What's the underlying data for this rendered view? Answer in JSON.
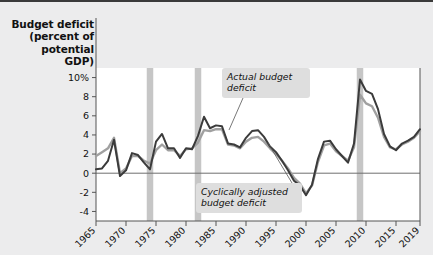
{
  "chart": {
    "type": "line",
    "y_axis_title": "Budget deficit (percent of potential GDP)",
    "y_axis_title_lines": [
      "Budget deficit",
      "(percent of",
      "potential",
      "GDP)"
    ],
    "y_ticks": [
      "10%",
      "8",
      "6",
      "4",
      "2",
      "0",
      "-2",
      "-4"
    ],
    "y_tick_values": [
      10,
      8,
      6,
      4,
      2,
      0,
      -2,
      -4
    ],
    "x_ticks": [
      "1965",
      "1970",
      "1975",
      "1980",
      "1985",
      "1990",
      "1995",
      "2000",
      "2005",
      "2010",
      "2015",
      "2019"
    ],
    "x_tick_values": [
      1965,
      1970,
      1975,
      1980,
      1985,
      1990,
      1995,
      2000,
      2005,
      2010,
      2015,
      2019
    ],
    "annotations": [
      {
        "id": "actual",
        "text": "Actual budget deficit"
      },
      {
        "id": "cyclically-adjusted",
        "text": "Cyclically adjusted budget deficit"
      }
    ],
    "colors": {
      "background": "#ececed",
      "plot_background": "#ffffff",
      "actual_line": "#3b3b3b",
      "cyclical_line": "#a0a0a0",
      "recession_band": "#c6c6c6",
      "zero_line": "#6e6e6e",
      "axis": "#555555",
      "annotation_box": "#dedede"
    },
    "recession_bands": [
      1974,
      1982,
      2009
    ],
    "legend_position": "inline-annotations",
    "grid": false,
    "xlim": [
      1965,
      2019
    ],
    "ylim": [
      -5,
      11
    ]
  },
  "chart_data": {
    "type": "line",
    "title": "",
    "xlabel": "",
    "ylabel": "Budget deficit (percent of potential GDP)",
    "xlim": [
      1965,
      2019
    ],
    "ylim": [
      -5,
      11
    ],
    "grid": false,
    "legend_position": "inline-annotations",
    "x": [
      1965,
      1966,
      1967,
      1968,
      1969,
      1970,
      1971,
      1972,
      1973,
      1974,
      1975,
      1976,
      1977,
      1978,
      1979,
      1980,
      1981,
      1982,
      1983,
      1984,
      1985,
      1986,
      1987,
      1988,
      1989,
      1990,
      1991,
      1992,
      1993,
      1994,
      1995,
      1996,
      1997,
      1998,
      1999,
      2000,
      2001,
      2002,
      2003,
      2004,
      2005,
      2006,
      2007,
      2008,
      2009,
      2010,
      2011,
      2012,
      2013,
      2014,
      2015,
      2016,
      2017,
      2018,
      2019
    ],
    "series": [
      {
        "name": "Actual budget deficit",
        "color": "#3b3b3b",
        "values": [
          0.4,
          0.5,
          1.3,
          3.5,
          -0.3,
          0.3,
          2.1,
          1.9,
          1.1,
          0.4,
          3.3,
          4.1,
          2.6,
          2.6,
          1.6,
          2.6,
          2.5,
          3.9,
          5.9,
          4.7,
          5.0,
          4.9,
          3.1,
          3.0,
          2.7,
          3.7,
          4.4,
          4.5,
          3.8,
          2.8,
          2.2,
          1.3,
          0.3,
          -0.8,
          -1.3,
          -2.3,
          -1.2,
          1.5,
          3.3,
          3.4,
          2.5,
          1.8,
          1.1,
          3.1,
          9.8,
          8.6,
          8.3,
          6.7,
          4.1,
          2.8,
          2.4,
          3.1,
          3.4,
          3.8,
          4.6
        ]
      },
      {
        "name": "Cyclically adjusted budget deficit",
        "color": "#a0a0a0",
        "values": [
          1.8,
          2.2,
          2.6,
          3.7,
          0.0,
          0.5,
          1.8,
          1.8,
          1.3,
          1.0,
          2.4,
          3.0,
          2.4,
          2.4,
          1.8,
          2.5,
          2.6,
          3.2,
          4.5,
          4.4,
          4.6,
          4.6,
          3.0,
          2.9,
          2.6,
          3.3,
          3.7,
          3.8,
          3.3,
          2.6,
          2.0,
          1.3,
          0.5,
          -0.5,
          -1.1,
          -2.1,
          -1.3,
          1.2,
          2.9,
          3.1,
          2.3,
          1.8,
          1.3,
          2.7,
          8.2,
          7.3,
          7.0,
          5.8,
          3.8,
          2.7,
          2.5,
          3.0,
          3.3,
          3.7,
          4.4
        ]
      }
    ],
    "recession_bands": [
      {
        "year": 1974,
        "label": "1974 recession"
      },
      {
        "year": 1982,
        "label": "1982 recession"
      },
      {
        "year": 2009,
        "label": "2009 recession"
      }
    ],
    "annotations": [
      {
        "text": "Actual budget deficit",
        "points_to_series": "Actual budget deficit"
      },
      {
        "text": "Cyclically adjusted budget deficit",
        "points_to_series": "Cyclically adjusted budget deficit"
      }
    ]
  }
}
